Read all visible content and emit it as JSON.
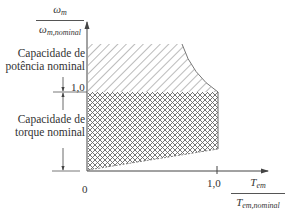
{
  "diagram": {
    "type": "operating-region",
    "y_axis": {
      "label_numerator": "ω",
      "label_numerator_sub": "m",
      "label_denominator": "ω",
      "label_denominator_sub": "m,nominal",
      "tick_1": "1,0"
    },
    "x_axis": {
      "label_numerator": "T",
      "label_numerator_sub": "em",
      "label_denominator": "T",
      "label_denominator_sub": "em,nominal",
      "tick_0": "0",
      "tick_1": "1,0"
    },
    "regions": [
      {
        "name": "power",
        "label_line1": "Capacidade de",
        "label_line2": "potência nominal",
        "pattern": "diagonal-hatch"
      },
      {
        "name": "torque",
        "label_line1": "Capacidade de",
        "label_line2": "torque nominal",
        "pattern": "cross-hatch"
      }
    ],
    "colors": {
      "line": "#555555",
      "hatch": "#777777",
      "text": "#333333"
    }
  }
}
